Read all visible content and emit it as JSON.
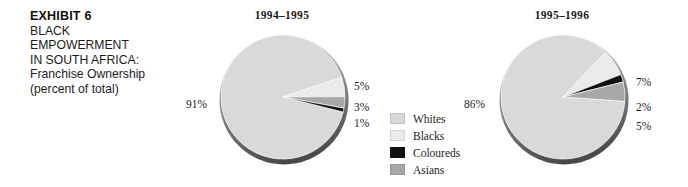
{
  "caption": {
    "exhibit_number": "EXHIBIT 6",
    "lines": [
      "BLACK",
      "EMPOWERMENT",
      "IN SOUTH AFRICA:",
      "Franchise Ownership",
      "(percent of total)"
    ]
  },
  "legend": {
    "items": [
      {
        "label": "Whites",
        "color": "#d9d9d9"
      },
      {
        "label": "Blacks",
        "color": "#eaeaea"
      },
      {
        "label": "Coloureds",
        "color": "#111111"
      },
      {
        "label": "Asians",
        "color": "#a8a8a8"
      }
    ]
  },
  "colors": {
    "whites": "#d9d9d9",
    "blacks": "#eaeaea",
    "coloureds": "#111111",
    "asians": "#a8a8a8",
    "rim_light": "#b4b4b4",
    "rim_dark": "#4a4a4a",
    "text": "#1d1d1d"
  },
  "chart_data": [
    {
      "type": "pie",
      "title": "1994–1995",
      "categories": [
        "Whites",
        "Blacks",
        "Asians",
        "Coloureds"
      ],
      "values": [
        91,
        5,
        3,
        1
      ],
      "labels": [
        "91%",
        "5%",
        "3%",
        "1%"
      ],
      "colors": [
        "#d9d9d9",
        "#eaeaea",
        "#a8a8a8",
        "#111111"
      ],
      "unit": "percent of total",
      "legend_position": "center"
    },
    {
      "type": "pie",
      "title": "1995–1996",
      "categories": [
        "Whites",
        "Blacks",
        "Coloureds",
        "Asians"
      ],
      "values": [
        86,
        7,
        2,
        5
      ],
      "labels": [
        "86%",
        "7%",
        "2%",
        "5%"
      ],
      "colors": [
        "#d9d9d9",
        "#eaeaea",
        "#111111",
        "#a8a8a8"
      ],
      "unit": "percent of total",
      "legend_position": "center"
    }
  ]
}
